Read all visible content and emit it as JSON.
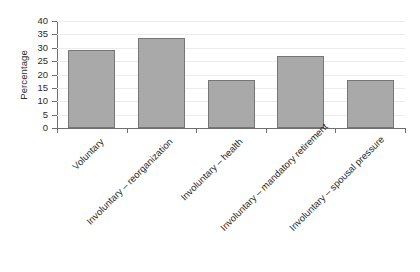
{
  "chart_data": {
    "type": "bar",
    "title": "",
    "subtitle": "",
    "xlabel": "",
    "ylabel": "Percentage",
    "categories": [
      "Voluntary",
      "Involuntary – reorganization",
      "Involuntary – health",
      "Involuntary – mandatory retirement",
      "Involuntary – spousal pressure"
    ],
    "values": [
      29,
      33.5,
      18,
      27,
      18
    ],
    "ylim": [
      0,
      40
    ],
    "ytick_step": 5,
    "yticks": [
      0,
      5,
      10,
      15,
      20,
      25,
      30,
      35,
      40
    ],
    "ytick_labels": [
      "0",
      "5",
      "10",
      "15",
      "20",
      "25",
      "30",
      "35",
      "40"
    ],
    "grid": true,
    "grid_axis": "y",
    "legend": false,
    "legend_position": "none",
    "bar_fill_color": "#a9a9a9",
    "bar_border_color": "#767676",
    "gridline_color": "#ececec",
    "axis_color": "#6e6e6e",
    "text_color": "#2b2b2b",
    "xtick_label_rotation": -45
  }
}
